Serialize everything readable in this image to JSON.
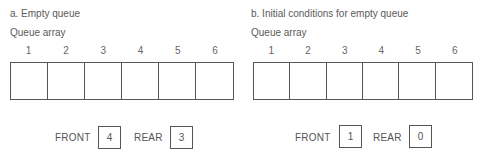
{
  "panels": [
    {
      "caption": "a. Empty queue",
      "array_label": "Queue array",
      "indices": [
        "1",
        "2",
        "3",
        "4",
        "5",
        "6"
      ],
      "cells": [
        "",
        "",
        "",
        "",
        "",
        ""
      ],
      "front_label": "FRONT",
      "front_value": "4",
      "rear_label": "REAR",
      "rear_value": "3"
    },
    {
      "caption": "b. Initial conditions for empty queue",
      "array_label": "Queue array",
      "indices": [
        "1",
        "2",
        "3",
        "4",
        "5",
        "6"
      ],
      "cells": [
        "",
        "",
        "",
        "",
        "",
        ""
      ],
      "front_label": "FRONT",
      "front_value": "1",
      "rear_label": "REAR",
      "rear_value": "0"
    }
  ]
}
